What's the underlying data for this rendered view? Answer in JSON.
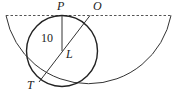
{
  "diagram": {
    "type": "geometry",
    "labels": {
      "P": "P",
      "O": "O",
      "L": "L",
      "T": "T",
      "radius": "10"
    },
    "elements": {
      "diameter_line": "dashed horizontal line through O",
      "large_semicircle": "lower semicircle centered at O",
      "small_circle": "circle centered at L, tangent to diameter at P and to semicircle at T",
      "segment_PL": "radius of small circle",
      "segment_OT": "line from O through L to T"
    },
    "colors": {
      "stroke": "#222222",
      "dashed": "#555555"
    }
  }
}
